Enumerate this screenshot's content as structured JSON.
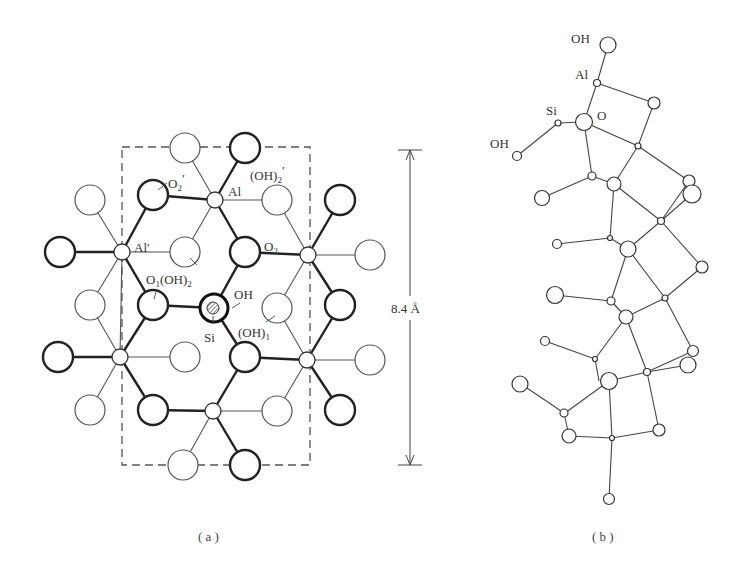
{
  "figure": {
    "panel_a": {
      "caption": "( a )",
      "labels": {
        "o2_prime": "O",
        "o2_prime_sub": "2",
        "o2_prime_mark": "′",
        "al": "Al",
        "oh2_prime": "(OH)",
        "oh2_prime_sub": "2",
        "oh2_prime_mark": "′",
        "al_prime": "Al′",
        "o2": "O",
        "o2_sub": "2",
        "o1_oh2": "O",
        "o1_sub": "1",
        "o1_oh2_rest": "(OH)",
        "o1_oh2_sub": "2",
        "oh": "OH",
        "si": "Si",
        "oh1": "(OH)",
        "oh1_sub": "1"
      },
      "dimension": "8.4 Å"
    },
    "panel_b": {
      "caption": "( b )",
      "labels": {
        "oh_top": "OH",
        "al": "Al",
        "si": "Si",
        "o": "O",
        "oh_left": "OH"
      }
    },
    "colors": {
      "line": "#333333",
      "thin_line": "#555555",
      "background": "#ffffff"
    }
  }
}
